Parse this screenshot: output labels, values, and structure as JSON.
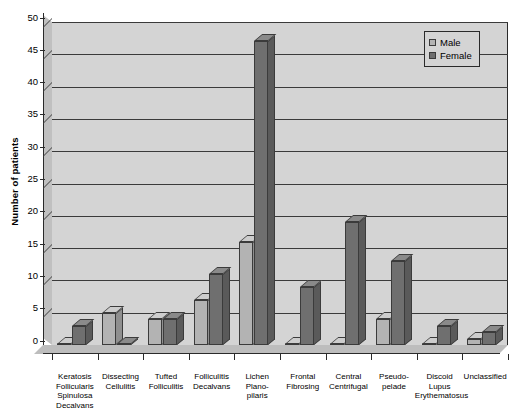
{
  "chart_data": {
    "type": "bar",
    "title": "",
    "xlabel": "",
    "ylabel": "Number of patients",
    "ylim": [
      0,
      50
    ],
    "ytick_step": 5,
    "yticks": [
      0,
      5,
      10,
      15,
      20,
      25,
      30,
      35,
      40,
      45,
      50
    ],
    "grid": true,
    "legend_position": "top-right",
    "categories": [
      "Keratosis Follicularis Spinulosa Decalvans",
      "Dissecting Cellulitis",
      "Tufted Folliculitis",
      "Folliculitis Decalvans",
      "Lichen Plano-pilaris",
      "Frontal Fibrosing",
      "Central Centrifugal",
      "Pseudo-pelade",
      "Discoid Lupus Erythematosus",
      "Unclassified"
    ],
    "category_lines": [
      [
        "Keratosis",
        "Follicularis",
        "Spinulosa",
        "Decalvans"
      ],
      [
        "Dissecting",
        "Cellulitis"
      ],
      [
        "Tufted",
        "Folliculitis"
      ],
      [
        "Folliculitis",
        "Decalvans"
      ],
      [
        "Lichen",
        "Plano-",
        "pilaris"
      ],
      [
        "Frontal",
        "Fibrosing"
      ],
      [
        "Central",
        "Centrifugal"
      ],
      [
        "Pseudo-",
        "pelade"
      ],
      [
        "Discoid",
        "Lupus",
        "Erythematosus"
      ],
      [
        "Unclassified"
      ]
    ],
    "series": [
      {
        "name": "Male",
        "color": "#b3b3b3",
        "values": [
          0,
          5,
          4,
          7,
          16,
          0,
          0,
          4,
          0,
          1
        ]
      },
      {
        "name": "Female",
        "color": "#6f6f6f",
        "values": [
          3,
          0,
          4,
          11,
          47,
          9,
          19,
          13,
          3,
          2
        ]
      }
    ]
  },
  "legend": {
    "items": [
      {
        "label": "Male"
      },
      {
        "label": "Female"
      }
    ]
  }
}
